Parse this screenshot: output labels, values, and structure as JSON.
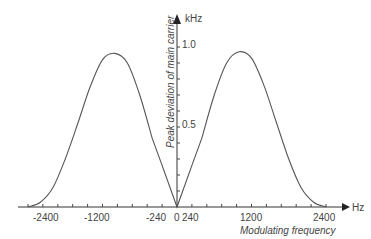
{
  "chart_data": {
    "type": "line",
    "title": "",
    "xlabel": "Modulating frequency",
    "x_unit": "Hz",
    "ylabel": "Peak deviation of main carrier",
    "y_unit": "kHz",
    "x_ticks": [
      "-2400",
      "-1200",
      "-240",
      "0",
      "240",
      "1200",
      "2400"
    ],
    "y_ticks": [
      "0.5",
      "1.0"
    ],
    "xlim": [
      -2400,
      2400
    ],
    "ylim": [
      0,
      1.1
    ],
    "grid": false,
    "legend": null,
    "series": [
      {
        "name": "Peak deviation",
        "x": [
          -2400,
          -2200,
          -2000,
          -1800,
          -1600,
          -1400,
          -1200,
          -1000,
          -800,
          -600,
          -400,
          -240,
          0,
          240,
          400,
          600,
          800,
          1000,
          1200,
          1400,
          1600,
          1800,
          2000,
          2200,
          2400
        ],
        "y": [
          0,
          0.03,
          0.12,
          0.3,
          0.52,
          0.75,
          0.92,
          0.96,
          0.9,
          0.7,
          0.43,
          0.26,
          0,
          0.26,
          0.43,
          0.7,
          0.9,
          0.97,
          0.93,
          0.76,
          0.53,
          0.3,
          0.12,
          0.03,
          0
        ]
      }
    ]
  }
}
